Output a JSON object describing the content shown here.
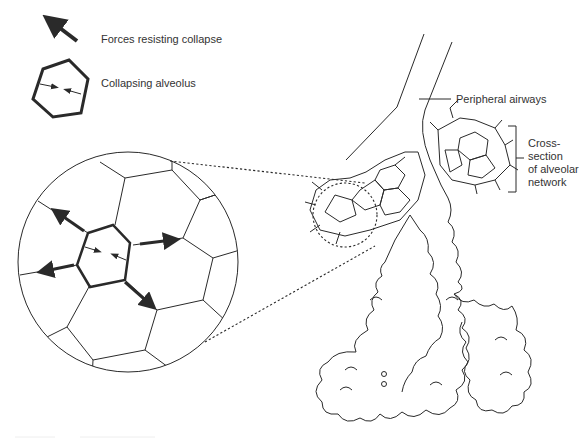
{
  "legend": {
    "items": [
      {
        "icon": "thick-arrow-icon",
        "label": "Forces resisting collapse"
      },
      {
        "icon": "collapsing-hexagon-icon",
        "label": "Collapsing alveolus"
      }
    ]
  },
  "labels": {
    "peripheral_airways": "Peripheral airways",
    "cross_section": [
      "Cross-",
      "section",
      "of alveolar",
      "network"
    ]
  },
  "colors": {
    "line": "#2a2a2a",
    "text": "#333333",
    "background": "#ffffff"
  }
}
